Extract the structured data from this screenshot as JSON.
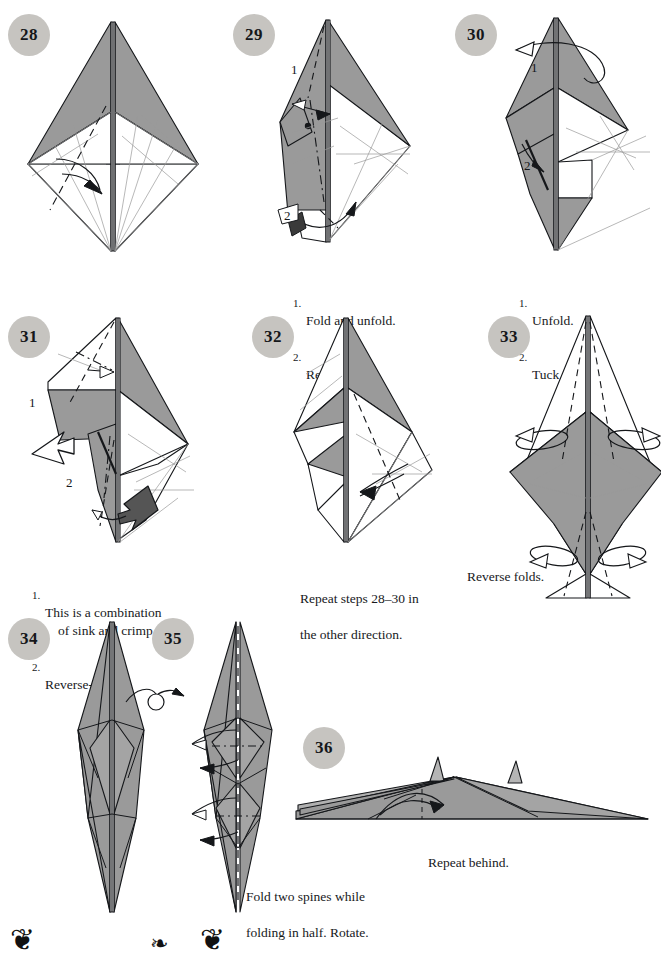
{
  "page": {
    "kind": "origami-instruction-diagram-page",
    "width": 661,
    "height": 953,
    "background": "#ffffff",
    "ink": "#15171a",
    "badge_fill": "#c6c4c0",
    "paper_front": "#9a9a9a",
    "paper_back": "#ffffff"
  },
  "steps": [
    {
      "number": "28",
      "badge_x": 8,
      "badge_y": 14,
      "caption": null,
      "markers": []
    },
    {
      "number": "29",
      "badge_x": 233,
      "badge_y": 14,
      "caption": {
        "items": [
          {
            "num": "1.",
            "text": "Fold and unfold."
          },
          {
            "num": "2.",
            "text": "Reverse-fold."
          }
        ]
      },
      "markers": [
        {
          "label": "1",
          "x": 291,
          "y": 68
        },
        {
          "label": "2",
          "x": 284,
          "y": 214
        }
      ]
    },
    {
      "number": "30",
      "badge_x": 455,
      "badge_y": 14,
      "caption": {
        "items": [
          {
            "num": "1.",
            "text": "Unfold."
          },
          {
            "num": "2.",
            "text": "Tuck inside."
          }
        ]
      },
      "markers": [
        {
          "label": "1",
          "x": 531,
          "y": 66
        },
        {
          "label": "2",
          "x": 524,
          "y": 163
        }
      ]
    },
    {
      "number": "31",
      "badge_x": 8,
      "badge_y": 316,
      "caption": {
        "items": [
          {
            "num": "1.",
            "text": "This is a combination",
            "cont": "of sink and crimp fold."
          },
          {
            "num": "2.",
            "text": "Reverse-fold."
          }
        ]
      },
      "markers": [
        {
          "label": "1",
          "x": 29,
          "y": 401
        },
        {
          "label": "2",
          "x": 66,
          "y": 481
        }
      ]
    },
    {
      "number": "32",
      "badge_x": 252,
      "badge_y": 316,
      "caption": {
        "lines": [
          "Repeat steps 28–30 in",
          "the other direction."
        ]
      },
      "markers": []
    },
    {
      "number": "33",
      "badge_x": 488,
      "badge_y": 316,
      "caption": {
        "lines": [
          "Reverse folds."
        ]
      },
      "markers": []
    },
    {
      "number": "34",
      "badge_x": 8,
      "badge_y": 618,
      "caption": null,
      "markers": []
    },
    {
      "number": "35",
      "badge_x": 152,
      "badge_y": 618,
      "caption": {
        "lines": [
          "Fold two spines while",
          "folding in half. Rotate."
        ]
      },
      "markers": []
    },
    {
      "number": "36",
      "badge_x": 303,
      "badge_y": 727,
      "caption": {
        "lines": [
          "Repeat behind."
        ]
      },
      "markers": []
    }
  ],
  "captions": {
    "c29": {
      "l1_num": "1.",
      "l1": "Fold and unfold.",
      "l2_num": "2.",
      "l2": "Reverse-fold."
    },
    "c30": {
      "l1_num": "1.",
      "l1": "Unfold.",
      "l2_num": "2.",
      "l2": "Tuck inside."
    },
    "c31": {
      "l1_num": "1.",
      "l1": "This is a combination",
      "l1b": "of sink and crimp fold.",
      "l2_num": "2.",
      "l2": "Reverse-fold."
    },
    "c32": {
      "l1": "Repeat steps 28–30 in",
      "l2": "the other direction."
    },
    "c33": {
      "l1": "Reverse folds."
    },
    "c35": {
      "l1": "Fold two spines while",
      "l2": "folding in half. Rotate."
    },
    "c36": {
      "l1": "Repeat behind."
    }
  },
  "markers": {
    "m29_1": "1",
    "m29_2": "2",
    "m30_1": "1",
    "m30_2": "2",
    "m31_1": "1",
    "m31_2": "2"
  },
  "badges": {
    "b28": "28",
    "b29": "29",
    "b30": "30",
    "b31": "31",
    "b32": "32",
    "b33": "33",
    "b34": "34",
    "b35": "35",
    "b36": "36"
  },
  "ornaments": {
    "left": "❦",
    "mid": "❧",
    "right": "❦"
  }
}
